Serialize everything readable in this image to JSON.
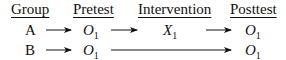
{
  "headers": {
    "group": "Group",
    "pretest": "Pretest",
    "intervention": "Intervention",
    "posttest": "Posttest"
  },
  "rows": [
    {
      "group": "A",
      "pretest": {
        "symbol": "O",
        "sub": "1"
      },
      "intervention": {
        "symbol": "X",
        "sub": "1"
      },
      "posttest": {
        "symbol": "O",
        "sub": "1"
      }
    },
    {
      "group": "B",
      "pretest": {
        "symbol": "O",
        "sub": "1"
      },
      "intervention": null,
      "posttest": {
        "symbol": "O",
        "sub": "1"
      }
    }
  ]
}
